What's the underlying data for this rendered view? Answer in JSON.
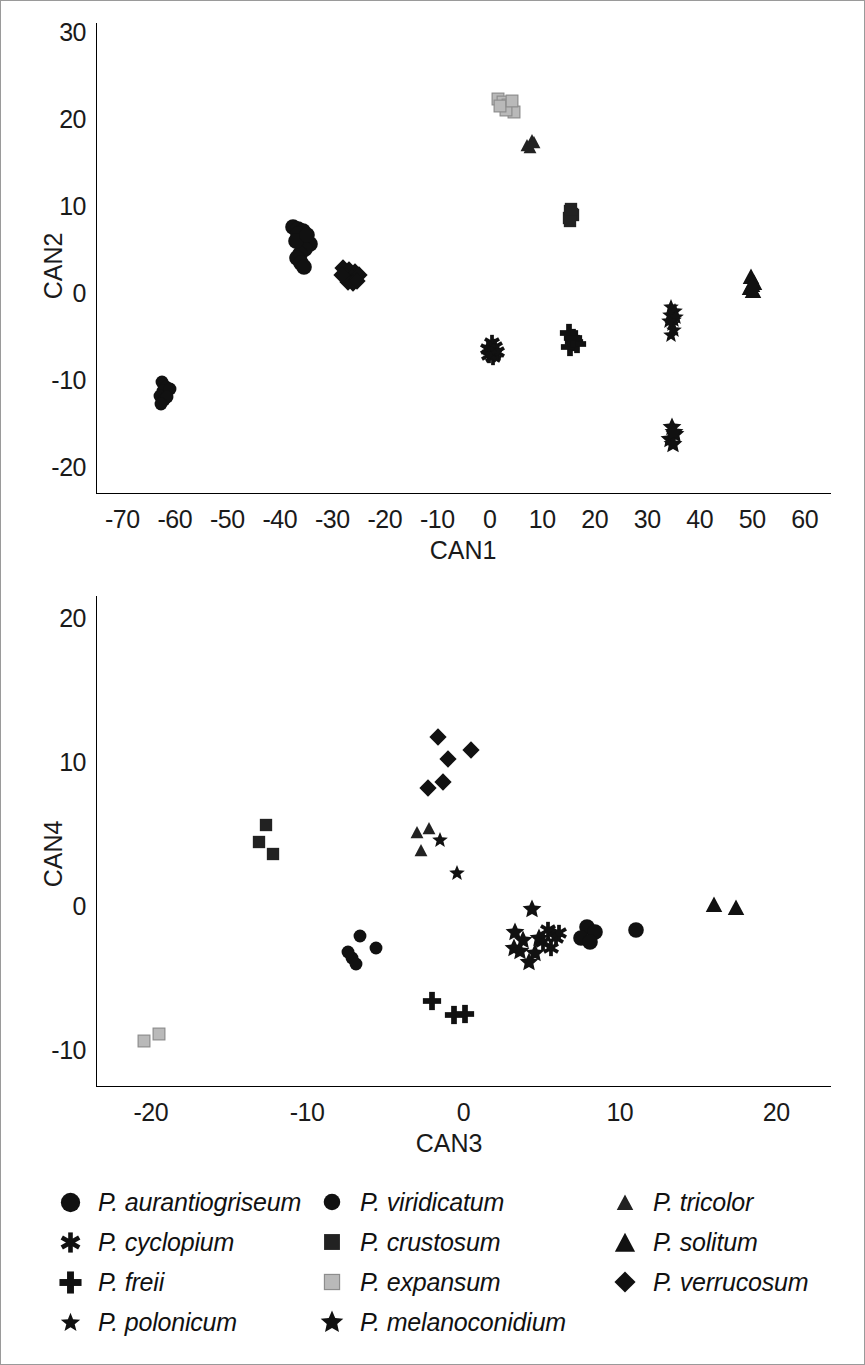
{
  "figure": {
    "title": "",
    "border_color": "#9a9a9a"
  },
  "species": [
    {
      "key": "aurantiogriseum",
      "label": "P. aurantiogriseum",
      "marker": "circle",
      "size": 17,
      "color": "#111111"
    },
    {
      "key": "cyclopium",
      "label": "P. cyclopium",
      "marker": "asterisk",
      "size": 17,
      "color": "#111111"
    },
    {
      "key": "freii",
      "label": "P. freii",
      "marker": "plus",
      "size": 19,
      "color": "#111111"
    },
    {
      "key": "polonicum",
      "label": "P. polonicum",
      "marker": "star",
      "size": 17,
      "color": "#111111"
    },
    {
      "key": "viridicatum",
      "label": "P. viridicatum",
      "marker": "circle",
      "size": 14,
      "color": "#111111"
    },
    {
      "key": "crustosum",
      "label": "P. crustosum",
      "marker": "square",
      "size": 14,
      "color": "#222222"
    },
    {
      "key": "expansum",
      "label": "P. expansum",
      "marker": "square-light",
      "size": 14,
      "color": "#b9b9b9"
    },
    {
      "key": "melanoconidium",
      "label": "P. melanoconidium",
      "marker": "star-bold",
      "size": 20,
      "color": "#111111"
    },
    {
      "key": "tricolor",
      "label": "P. tricolor",
      "marker": "triangle",
      "size": 14,
      "color": "#222222"
    },
    {
      "key": "solitum",
      "label": "P. solitum",
      "marker": "triangle",
      "size": 18,
      "color": "#111111"
    },
    {
      "key": "verrucosum",
      "label": "P. verrucosum",
      "marker": "diamond",
      "size": 18,
      "color": "#111111"
    }
  ],
  "legend": {
    "columns": [
      [
        "aurantiogriseum",
        "cyclopium",
        "freii",
        "polonicum"
      ],
      [
        "viridicatum",
        "crustosum",
        "expansum",
        "melanoconidium"
      ],
      [
        "tricolor",
        "solitum",
        "verrucosum"
      ]
    ]
  },
  "chart_data": [
    {
      "id": "top",
      "type": "scatter",
      "title": "",
      "xlabel": "CAN1",
      "ylabel": "CAN2",
      "xlim": [
        -75,
        65
      ],
      "ylim": [
        -23,
        31
      ],
      "xticks": [
        -70,
        -60,
        -50,
        -40,
        -30,
        -20,
        -10,
        0,
        10,
        20,
        30,
        40,
        50,
        60
      ],
      "yticks": [
        -20,
        -10,
        0,
        10,
        20,
        30
      ],
      "grid": false,
      "legend_position": "below-figure",
      "series": [
        {
          "name": "P. expansum",
          "key": "expansum",
          "points": [
            [
              1.5,
              22.3
            ],
            [
              2.6,
              21.9
            ],
            [
              3.4,
              21.6
            ],
            [
              4.0,
              21.2
            ],
            [
              4.6,
              20.8
            ],
            [
              3.0,
              21.0
            ],
            [
              2.0,
              21.5
            ],
            [
              4.2,
              22.0
            ]
          ]
        },
        {
          "name": "P. tricolor",
          "key": "tricolor",
          "points": [
            [
              8.0,
              17.6
            ],
            [
              7.0,
              17.0
            ],
            [
              7.6,
              16.8
            ],
            [
              8.4,
              17.3
            ]
          ]
        },
        {
          "name": "P. crustosum",
          "key": "crustosum",
          "points": [
            [
              15.2,
              9.4
            ],
            [
              15.6,
              9.0
            ],
            [
              15.0,
              8.6
            ],
            [
              15.8,
              8.9
            ],
            [
              15.3,
              8.3
            ],
            [
              15.5,
              9.6
            ]
          ]
        },
        {
          "name": "P. aurantiogriseum",
          "key": "aurantiogriseum",
          "points": [
            [
              -37.5,
              7.6
            ],
            [
              -36.5,
              7.3
            ],
            [
              -35.5,
              7.1
            ],
            [
              -36.0,
              6.4
            ],
            [
              -35.0,
              6.0
            ],
            [
              -34.3,
              5.6
            ],
            [
              -35.2,
              5.0
            ],
            [
              -36.2,
              4.5
            ],
            [
              -36.8,
              4.0
            ],
            [
              -36.0,
              3.4
            ],
            [
              -35.4,
              3.0
            ],
            [
              -36.6,
              6.8
            ],
            [
              -37.0,
              6.0
            ],
            [
              -34.8,
              6.6
            ]
          ]
        },
        {
          "name": "P. verrucosum",
          "key": "verrucosum",
          "points": [
            [
              -28.0,
              2.8
            ],
            [
              -26.8,
              2.6
            ],
            [
              -25.6,
              2.4
            ],
            [
              -27.4,
              1.9
            ],
            [
              -26.2,
              1.8
            ],
            [
              -25.0,
              2.0
            ],
            [
              -27.0,
              1.2
            ],
            [
              -26.0,
              1.1
            ],
            [
              -28.2,
              2.0
            ],
            [
              -25.2,
              1.4
            ]
          ]
        },
        {
          "name": "P. solitum",
          "key": "solitum",
          "points": [
            [
              49.8,
              1.9
            ],
            [
              50.3,
              1.3
            ],
            [
              49.6,
              0.7
            ],
            [
              50.2,
              0.3
            ],
            [
              49.9,
              1.0
            ]
          ]
        },
        {
          "name": "P. polonicum",
          "key": "polonicum",
          "points": [
            [
              34.6,
              -1.6
            ],
            [
              35.2,
              -2.1
            ],
            [
              34.4,
              -2.6
            ],
            [
              35.0,
              -3.1
            ],
            [
              34.8,
              -3.6
            ],
            [
              35.4,
              -2.8
            ],
            [
              34.2,
              -3.2
            ],
            [
              35.0,
              -4.3
            ],
            [
              34.6,
              -4.9
            ]
          ]
        },
        {
          "name": "P. freii",
          "key": "freii",
          "points": [
            [
              15.0,
              -4.6
            ],
            [
              16.0,
              -5.6
            ],
            [
              15.2,
              -6.2
            ],
            [
              16.6,
              -5.9
            ],
            [
              15.8,
              -5.2
            ]
          ]
        },
        {
          "name": "P. cyclopium",
          "key": "cyclopium",
          "points": [
            [
              0.4,
              -5.8
            ],
            [
              1.0,
              -6.2
            ],
            [
              0.0,
              -6.6
            ],
            [
              0.8,
              -7.0
            ],
            [
              -0.4,
              -6.4
            ],
            [
              0.6,
              -7.4
            ],
            [
              1.4,
              -6.8
            ],
            [
              -0.2,
              -7.2
            ]
          ]
        },
        {
          "name": "P. viridicatum",
          "key": "viridicatum",
          "points": [
            [
              -62.5,
              -10.3
            ],
            [
              -61.6,
              -10.8
            ],
            [
              -62.2,
              -11.3
            ],
            [
              -61.0,
              -11.0
            ],
            [
              -62.8,
              -11.8
            ],
            [
              -62.0,
              -12.3
            ],
            [
              -61.4,
              -12.0
            ],
            [
              -62.6,
              -12.8
            ]
          ]
        },
        {
          "name": "P. melanoconidium",
          "key": "melanoconidium",
          "points": [
            [
              34.8,
              -15.4
            ],
            [
              35.3,
              -16.2
            ],
            [
              34.4,
              -16.8
            ],
            [
              34.9,
              -17.4
            ],
            [
              35.0,
              -16.0
            ]
          ]
        }
      ]
    },
    {
      "id": "bottom",
      "type": "scatter",
      "title": "",
      "xlabel": "CAN3",
      "ylabel": "CAN4",
      "xlim": [
        -23.5,
        23.5
      ],
      "ylim": [
        -12.5,
        21.5
      ],
      "xticks": [
        -20,
        -10,
        0,
        10,
        20
      ],
      "yticks": [
        -10,
        0,
        10,
        20
      ],
      "grid": false,
      "legend_position": "below-figure",
      "series": [
        {
          "name": "P. verrucosum",
          "key": "verrucosum",
          "points": [
            [
              -1.6,
              11.7
            ],
            [
              0.5,
              10.8
            ],
            [
              -1.0,
              10.2
            ],
            [
              -2.3,
              8.2
            ],
            [
              -1.3,
              8.6
            ]
          ]
        },
        {
          "name": "P. crustosum",
          "key": "crustosum",
          "points": [
            [
              -12.6,
              5.6
            ],
            [
              -13.1,
              4.4
            ],
            [
              -12.2,
              3.6
            ]
          ]
        },
        {
          "name": "P. tricolor",
          "key": "tricolor",
          "points": [
            [
              -3.0,
              5.1
            ],
            [
              -2.2,
              5.4
            ],
            [
              -2.7,
              3.9
            ]
          ]
        },
        {
          "name": "P. polonicum",
          "key": "polonicum",
          "points": [
            [
              -1.5,
              4.6
            ],
            [
              -0.4,
              2.3
            ]
          ]
        },
        {
          "name": "P. solitum",
          "key": "solitum",
          "points": [
            [
              16.0,
              0.1
            ],
            [
              17.4,
              -0.1
            ]
          ]
        },
        {
          "name": "P. melanoconidium",
          "key": "melanoconidium",
          "points": [
            [
              4.4,
              -0.2
            ],
            [
              3.3,
              -1.8
            ],
            [
              3.8,
              -2.4
            ],
            [
              3.2,
              -2.9
            ],
            [
              4.6,
              -3.3
            ],
            [
              4.2,
              -3.9
            ],
            [
              3.6,
              -3.1
            ],
            [
              4.8,
              -2.2
            ]
          ]
        },
        {
          "name": "P. cyclopium",
          "key": "cyclopium",
          "points": [
            [
              5.4,
              -1.7
            ],
            [
              5.9,
              -2.2
            ],
            [
              5.1,
              -2.5
            ],
            [
              5.6,
              -2.9
            ],
            [
              6.1,
              -1.9
            ]
          ]
        },
        {
          "name": "P. aurantiogriseum",
          "key": "aurantiogriseum",
          "points": [
            [
              7.9,
              -1.5
            ],
            [
              8.4,
              -1.8
            ],
            [
              7.5,
              -2.2
            ],
            [
              8.1,
              -2.5
            ],
            [
              11.0,
              -1.7
            ]
          ]
        },
        {
          "name": "P. viridicatum",
          "key": "viridicatum",
          "points": [
            [
              -6.6,
              -2.1
            ],
            [
              -5.6,
              -2.9
            ],
            [
              -7.1,
              -3.6
            ],
            [
              -6.9,
              -4.0
            ],
            [
              -7.4,
              -3.2
            ]
          ]
        },
        {
          "name": "P. freii",
          "key": "freii",
          "points": [
            [
              -2.0,
              -6.6
            ],
            [
              -0.6,
              -7.6
            ],
            [
              0.1,
              -7.5
            ]
          ]
        },
        {
          "name": "P. expansum",
          "key": "expansum",
          "points": [
            [
              -20.4,
              -9.4
            ],
            [
              -19.5,
              -8.9
            ]
          ]
        }
      ]
    }
  ]
}
